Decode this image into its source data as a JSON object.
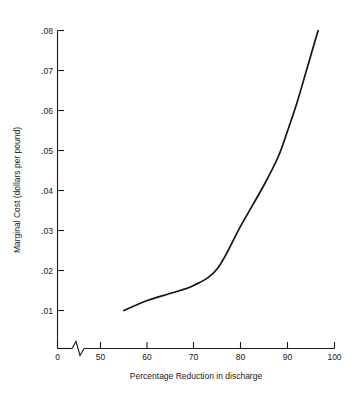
{
  "chart_data": {
    "type": "line",
    "title": "",
    "xlabel": "Percentage Reduction in discharge",
    "ylabel": "Marginal Cost (dollars per pound)",
    "xlim": [
      0,
      100
    ],
    "ylim": [
      0,
      0.08
    ],
    "grid": false,
    "legend": null,
    "axis_break": {
      "axis": "x",
      "between": [
        0,
        50
      ],
      "symbol": "zigzag"
    },
    "xticks": [
      0,
      50,
      60,
      70,
      80,
      90,
      100
    ],
    "xtick_labels": [
      "0",
      "50",
      "60",
      "70",
      "80",
      "90",
      "100"
    ],
    "yticks": [
      0.01,
      0.02,
      0.03,
      0.04,
      0.05,
      0.06,
      0.07,
      0.08
    ],
    "ytick_labels": [
      ".01",
      ".02",
      ".03",
      ".04",
      ".05",
      ".06",
      ".07",
      ".08"
    ],
    "series": [
      {
        "name": "Marginal Cost",
        "x": [
          55,
          60,
          65,
          70,
          75,
          80,
          85,
          88,
          90,
          92,
          94,
          95,
          96,
          96.5
        ],
        "values": [
          0.01,
          0.0125,
          0.0143,
          0.0163,
          0.0205,
          0.0312,
          0.0415,
          0.0485,
          0.055,
          0.062,
          0.07,
          0.074,
          0.078,
          0.08
        ]
      }
    ]
  },
  "axis": {
    "x_title": "Percentage Reduction in discharge",
    "y_title": "Marginal Cost (dollars per pound)",
    "x_labels": [
      "0",
      "50",
      "60",
      "70",
      "80",
      "90",
      "100"
    ],
    "y_labels": [
      ".01",
      ".02",
      ".03",
      ".04",
      ".05",
      ".06",
      ".07",
      ".08"
    ]
  },
  "colors": {
    "curve": "#141414",
    "axis": "#1a1a1a",
    "background": "#ffffff"
  }
}
